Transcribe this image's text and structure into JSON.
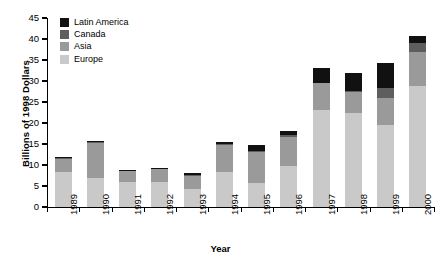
{
  "chart_data": {
    "type": "bar",
    "subtype": "stacked-vertical",
    "title": "",
    "xlabel": "Year",
    "ylabel": "Billions of 1998 Dollars",
    "ylim": [
      0,
      45
    ],
    "yticks": [
      0,
      5,
      10,
      15,
      20,
      25,
      30,
      35,
      40,
      45
    ],
    "grid": false,
    "legend_position": "top-left",
    "categories": [
      "1989",
      "1990",
      "1991",
      "1992",
      "1993",
      "1994",
      "1995",
      "1996",
      "1997",
      "1998",
      "1999",
      "2000"
    ],
    "series": [
      {
        "name": "Europe",
        "color": "#c9c9c9",
        "values": [
          8.3,
          7.0,
          6.0,
          6.0,
          4.2,
          8.3,
          5.6,
          9.8,
          23.0,
          22.5,
          19.5,
          28.7
        ]
      },
      {
        "name": "Asia",
        "color": "#9a9a9a",
        "values": [
          3.1,
          8.3,
          2.5,
          3.0,
          3.1,
          6.5,
          7.4,
          6.9,
          6.5,
          5.0,
          6.5,
          8.3
        ]
      },
      {
        "name": "Canada",
        "color": "#5e5e5e",
        "values": [
          0.3,
          0.2,
          0.2,
          0.2,
          0.3,
          0.3,
          0.4,
          0.4,
          0.0,
          0.2,
          2.4,
          2.0
        ]
      },
      {
        "name": "Latin America",
        "color": "#111111",
        "values": [
          0.3,
          0.3,
          0.1,
          0.1,
          0.4,
          0.5,
          1.3,
          1.1,
          3.5,
          4.1,
          6.0,
          1.7
        ]
      }
    ],
    "totals": [
      12.0,
      15.8,
      8.8,
      9.3,
      8.0,
      15.6,
      14.7,
      18.2,
      33.0,
      31.8,
      34.4,
      40.7
    ],
    "legend_order": [
      "Latin America",
      "Canada",
      "Asia",
      "Europe"
    ]
  }
}
